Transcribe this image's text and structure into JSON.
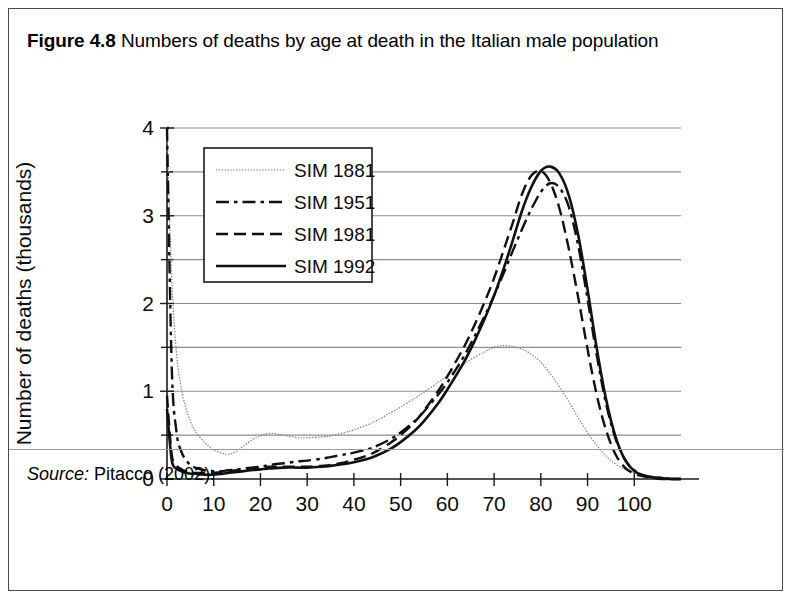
{
  "figure": {
    "label": "Figure 4.8",
    "caption": "Numbers of deaths by age at death in the Italian male population",
    "source_label": "Source:",
    "source_text": "Pitacco (2002)."
  },
  "chart_data": {
    "type": "line",
    "title": "Numbers of deaths by age at death in the Italian male population",
    "xlabel": "Age (years)",
    "ylabel": "Number of deaths (thousands)",
    "xlim": [
      0,
      110
    ],
    "ylim": [
      0,
      4
    ],
    "xticks": [
      0,
      10,
      20,
      30,
      40,
      50,
      60,
      70,
      80,
      90,
      100
    ],
    "xtick_labels": [
      "0",
      "10",
      "20",
      "30",
      "40",
      "50",
      "60",
      "70",
      "80",
      "90",
      "100"
    ],
    "yticks": [
      0,
      1,
      2,
      3,
      4
    ],
    "ytick_labels": [
      "0",
      "1",
      "2",
      "3",
      "4"
    ],
    "yticks_minor": [
      0.5,
      1.5,
      2.5,
      3.5
    ],
    "grid": "horizontal",
    "legend_position": "upper-left-inside",
    "x": [
      0,
      1,
      2,
      3,
      4,
      5,
      6,
      8,
      10,
      12,
      13,
      15,
      18,
      20,
      22,
      25,
      28,
      30,
      33,
      35,
      38,
      40,
      43,
      45,
      48,
      50,
      53,
      55,
      58,
      60,
      63,
      65,
      68,
      70,
      72,
      74,
      76,
      78,
      80,
      82,
      84,
      86,
      88,
      90,
      92,
      94,
      96,
      98,
      100,
      102,
      104,
      106,
      108,
      110
    ],
    "series": [
      {
        "name": "SIM 1881",
        "style": "dotted-thin",
        "color": "#7d7d7d",
        "values": [
          4.0,
          2.3,
          1.45,
          1.05,
          0.82,
          0.66,
          0.55,
          0.42,
          0.33,
          0.29,
          0.28,
          0.32,
          0.44,
          0.49,
          0.52,
          0.5,
          0.47,
          0.47,
          0.48,
          0.49,
          0.53,
          0.56,
          0.62,
          0.67,
          0.76,
          0.82,
          0.92,
          0.99,
          1.1,
          1.18,
          1.29,
          1.36,
          1.45,
          1.5,
          1.52,
          1.51,
          1.48,
          1.42,
          1.33,
          1.2,
          1.05,
          0.88,
          0.7,
          0.53,
          0.38,
          0.26,
          0.17,
          0.11,
          0.07,
          0.04,
          0.02,
          0.01,
          0.0,
          0.0
        ]
      },
      {
        "name": "SIM 1951",
        "style": "dash-dot",
        "color": "#111111",
        "values": [
          4.0,
          1.3,
          0.55,
          0.32,
          0.22,
          0.16,
          0.13,
          0.1,
          0.09,
          0.09,
          0.1,
          0.11,
          0.13,
          0.14,
          0.16,
          0.18,
          0.2,
          0.21,
          0.23,
          0.25,
          0.28,
          0.3,
          0.34,
          0.38,
          0.46,
          0.53,
          0.66,
          0.77,
          0.96,
          1.1,
          1.35,
          1.54,
          1.86,
          2.09,
          2.34,
          2.6,
          2.85,
          3.08,
          3.27,
          3.37,
          3.32,
          3.1,
          2.66,
          2.05,
          1.4,
          0.85,
          0.46,
          0.22,
          0.1,
          0.04,
          0.02,
          0.01,
          0.0,
          0.0
        ]
      },
      {
        "name": "SIM 1981",
        "style": "dashed",
        "color": "#111111",
        "values": [
          0.95,
          0.28,
          0.16,
          0.11,
          0.09,
          0.08,
          0.07,
          0.07,
          0.07,
          0.08,
          0.09,
          0.1,
          0.12,
          0.13,
          0.14,
          0.14,
          0.14,
          0.14,
          0.15,
          0.16,
          0.19,
          0.22,
          0.27,
          0.32,
          0.42,
          0.5,
          0.65,
          0.78,
          1.0,
          1.17,
          1.45,
          1.66,
          2.02,
          2.29,
          2.6,
          2.92,
          3.25,
          3.46,
          3.51,
          3.38,
          3.08,
          2.62,
          2.07,
          1.48,
          0.95,
          0.55,
          0.28,
          0.13,
          0.06,
          0.03,
          0.01,
          0.0,
          0.0,
          0.0
        ]
      },
      {
        "name": "SIM 1992",
        "style": "solid",
        "color": "#111111",
        "values": [
          0.8,
          0.22,
          0.12,
          0.09,
          0.07,
          0.06,
          0.06,
          0.05,
          0.05,
          0.06,
          0.07,
          0.08,
          0.1,
          0.11,
          0.12,
          0.13,
          0.13,
          0.13,
          0.14,
          0.15,
          0.17,
          0.19,
          0.23,
          0.27,
          0.35,
          0.42,
          0.55,
          0.66,
          0.86,
          1.02,
          1.28,
          1.48,
          1.83,
          2.09,
          2.39,
          2.72,
          3.06,
          3.33,
          3.51,
          3.56,
          3.48,
          3.23,
          2.78,
          2.16,
          1.48,
          0.9,
          0.48,
          0.22,
          0.09,
          0.04,
          0.02,
          0.01,
          0.0,
          0.0
        ]
      }
    ]
  }
}
